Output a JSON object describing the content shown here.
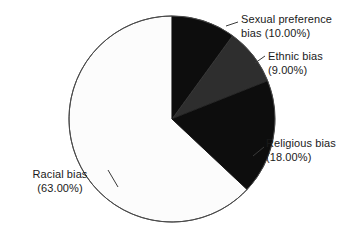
{
  "chart_data": {
    "type": "pie",
    "title": "",
    "subtitle": "",
    "xlabel": "",
    "ylabel": "",
    "legend_position": "none",
    "grid": false,
    "start_angle_deg": 90,
    "direction": "clockwise",
    "categories": [
      "Sexual preference bias",
      "Ethnic bias",
      "Religious bias",
      "Racial bias"
    ],
    "values": [
      10.0,
      9.0,
      18.0,
      63.0
    ],
    "value_unit": "percent",
    "slices": [
      {
        "name": "Sexual preference bias",
        "label_line1": "Sexual preference",
        "label_line2": "bias (10.00%)",
        "value": 10.0,
        "value_text": "(10.00%)",
        "color": "#0d0d0d"
      },
      {
        "name": "Ethnic bias",
        "label_line1": "Ethnic bias",
        "label_line2": "(9.00%)",
        "value": 9.0,
        "value_text": "(9.00%)",
        "color": "#2e2e2e"
      },
      {
        "name": "Religious bias",
        "label_line1": "Religious bias",
        "label_line2": "(18.00%)",
        "value": 18.0,
        "value_text": "(18.00%)",
        "color": "#0d0d0d"
      },
      {
        "name": "Racial bias",
        "label_line1": "Racial bias",
        "label_line2": "(63.00%)",
        "value": 63.0,
        "value_text": "(63.00%)",
        "color": "#fcfcfc"
      }
    ],
    "outline_color": "#4a4a4a",
    "background_color": "#ffffff",
    "text_color": "#1a1a1a"
  }
}
